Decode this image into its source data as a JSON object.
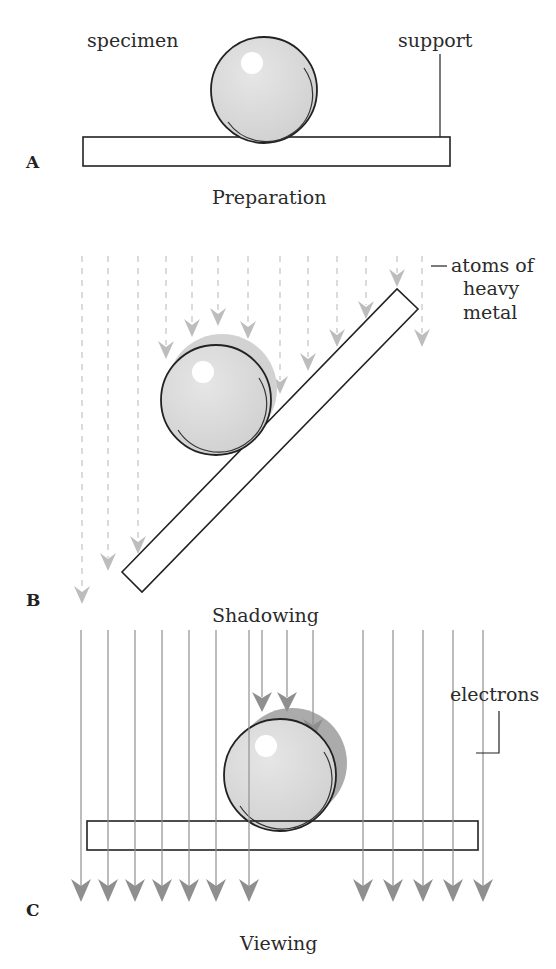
{
  "figure": {
    "panels": [
      {
        "id": "A",
        "letter": "A",
        "caption": "Preparation",
        "labels": {
          "specimen": "specimen",
          "support": "support"
        }
      },
      {
        "id": "B",
        "letter": "B",
        "caption": "Shadowing",
        "labels": {
          "atoms": [
            "atoms of",
            "heavy",
            "metal"
          ]
        }
      },
      {
        "id": "C",
        "letter": "C",
        "caption": "Viewing",
        "labels": {
          "electrons": "electrons"
        }
      }
    ]
  },
  "colors": {
    "sphere_fill": "#d8d8d8",
    "shadow_B": "#cfcfcf",
    "shadow_C": "#a9a9a9",
    "atom_arrow": "#bdbdbd",
    "electron_arrow": "#8f8f8f",
    "outline": "#222222"
  }
}
